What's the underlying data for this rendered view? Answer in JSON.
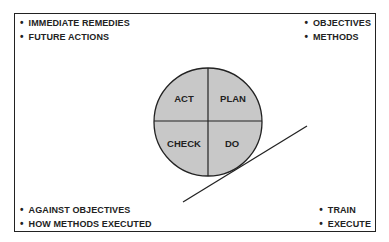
{
  "diagram": {
    "quadrants": [
      {
        "position": "top-left",
        "label": "ACT"
      },
      {
        "position": "top-right",
        "label": "PLAN"
      },
      {
        "position": "bottom-left",
        "label": "CHECK"
      },
      {
        "position": "bottom-right",
        "label": "DO"
      }
    ],
    "circle_fill": "#c8c8c8",
    "stroke_color": "#222222",
    "annotations": {
      "top_left": [
        "IMMEDIATE REMEDIES",
        "FUTURE ACTIONS"
      ],
      "top_right": [
        "OBJECTIVES",
        "METHODS"
      ],
      "bottom_left": [
        "AGAINST OBJECTIVES",
        "HOW METHODS EXECUTED"
      ],
      "bottom_right": [
        "TRAIN",
        "EXECUTE"
      ]
    }
  }
}
